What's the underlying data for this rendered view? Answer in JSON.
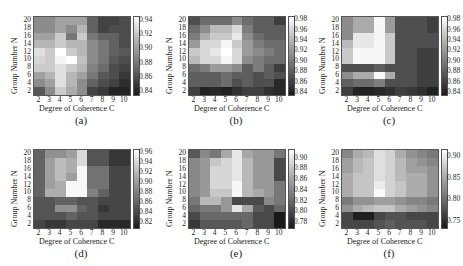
{
  "chart_data": [
    {
      "type": "heatmap",
      "caption": "(a)",
      "xlabel": "Degree of Coherence C",
      "ylabel": "Group Number N",
      "x_ticks": [
        "2",
        "3",
        "4",
        "5",
        "6",
        "7",
        "8",
        "9",
        "10"
      ],
      "y_ticks": [
        "20",
        "18",
        "16",
        "14",
        "12",
        "10",
        "8",
        "6",
        "4",
        "2"
      ],
      "colorbar_ticks": [
        "0.94",
        "0.92",
        "0.90",
        "0.88",
        "0.86",
        "0.84"
      ],
      "vrange": [
        0.835,
        0.945
      ],
      "values": [
        [
          0.89,
          0.89,
          0.9,
          0.9,
          0.9,
          0.87,
          0.855,
          0.855,
          0.86
        ],
        [
          0.89,
          0.89,
          0.9,
          0.89,
          0.91,
          0.87,
          0.855,
          0.86,
          0.86
        ],
        [
          0.9,
          0.9,
          0.92,
          0.88,
          0.92,
          0.88,
          0.87,
          0.87,
          0.86
        ],
        [
          0.91,
          0.91,
          0.92,
          0.91,
          0.91,
          0.89,
          0.88,
          0.87,
          0.86
        ],
        [
          0.93,
          0.92,
          0.945,
          0.92,
          0.91,
          0.89,
          0.88,
          0.87,
          0.865
        ],
        [
          0.925,
          0.92,
          0.94,
          0.945,
          0.915,
          0.89,
          0.88,
          0.865,
          0.86
        ],
        [
          0.92,
          0.92,
          0.93,
          0.92,
          0.91,
          0.885,
          0.875,
          0.86,
          0.855
        ],
        [
          0.9,
          0.91,
          0.93,
          0.91,
          0.9,
          0.88,
          0.865,
          0.86,
          0.85
        ],
        [
          0.89,
          0.9,
          0.93,
          0.91,
          0.89,
          0.87,
          0.86,
          0.855,
          0.845
        ],
        [
          0.865,
          0.89,
          0.92,
          0.905,
          0.89,
          0.855,
          0.85,
          0.84,
          0.84
        ]
      ]
    },
    {
      "type": "heatmap",
      "caption": "(b)",
      "xlabel": "Degree of Coherence C",
      "ylabel": "Group Number N",
      "x_ticks": [
        "2",
        "3",
        "4",
        "5",
        "6",
        "7",
        "8",
        "9",
        "10"
      ],
      "y_ticks": [
        "20",
        "18",
        "16",
        "14",
        "12",
        "10",
        "8",
        "6",
        "4",
        "2"
      ],
      "colorbar_ticks": [
        "0.98",
        "0.96",
        "0.94",
        "0.92",
        "0.90",
        "0.88",
        "0.86",
        "0.84"
      ],
      "vrange": [
        0.835,
        0.985
      ],
      "values": [
        [
          0.87,
          0.89,
          0.89,
          0.89,
          0.91,
          0.89,
          0.88,
          0.88,
          0.86
        ],
        [
          0.89,
          0.91,
          0.94,
          0.94,
          0.96,
          0.9,
          0.88,
          0.88,
          0.88
        ],
        [
          0.9,
          0.93,
          0.95,
          0.95,
          0.97,
          0.91,
          0.89,
          0.88,
          0.88
        ],
        [
          0.92,
          0.96,
          0.96,
          0.98,
          0.95,
          0.92,
          0.9,
          0.89,
          0.89
        ],
        [
          0.95,
          0.96,
          0.97,
          0.985,
          0.96,
          0.92,
          0.91,
          0.9,
          0.89
        ],
        [
          0.94,
          0.96,
          0.96,
          0.98,
          0.96,
          0.91,
          0.9,
          0.89,
          0.89
        ],
        [
          0.89,
          0.9,
          0.92,
          0.92,
          0.91,
          0.88,
          0.9,
          0.88,
          0.86
        ],
        [
          0.88,
          0.88,
          0.88,
          0.89,
          0.88,
          0.88,
          0.87,
          0.88,
          0.87
        ],
        [
          0.88,
          0.88,
          0.88,
          0.89,
          0.87,
          0.88,
          0.87,
          0.87,
          0.845
        ],
        [
          0.86,
          0.84,
          0.845,
          0.84,
          0.85,
          0.86,
          0.86,
          0.85,
          0.845
        ]
      ]
    },
    {
      "type": "heatmap",
      "caption": "(c)",
      "xlabel": "Degree of Coherence C",
      "ylabel": "Group Number N",
      "x_ticks": [
        "2",
        "3",
        "4",
        "5",
        "6",
        "7",
        "8",
        "9",
        "10"
      ],
      "y_ticks": [
        "20",
        "18",
        "16",
        "14",
        "12",
        "10",
        "8",
        "6",
        "4",
        "2"
      ],
      "colorbar_ticks": [
        "0.98",
        "0.96",
        "0.94",
        "0.92",
        "0.90",
        "0.88",
        "0.86",
        "0.84"
      ],
      "vrange": [
        0.835,
        0.985
      ],
      "values": [
        [
          0.91,
          0.93,
          0.93,
          0.98,
          0.92,
          0.87,
          0.87,
          0.87,
          0.86
        ],
        [
          0.91,
          0.93,
          0.93,
          0.98,
          0.92,
          0.87,
          0.87,
          0.87,
          0.86
        ],
        [
          0.91,
          0.97,
          0.97,
          0.98,
          0.95,
          0.87,
          0.87,
          0.87,
          0.87
        ],
        [
          0.94,
          0.97,
          0.97,
          0.98,
          0.95,
          0.87,
          0.87,
          0.87,
          0.87
        ],
        [
          0.95,
          0.98,
          0.98,
          0.98,
          0.95,
          0.87,
          0.87,
          0.86,
          0.86
        ],
        [
          0.95,
          0.98,
          0.98,
          0.98,
          0.95,
          0.87,
          0.87,
          0.86,
          0.86
        ],
        [
          0.87,
          0.87,
          0.87,
          0.88,
          0.87,
          0.87,
          0.87,
          0.86,
          0.86
        ],
        [
          0.91,
          0.93,
          0.93,
          0.98,
          0.93,
          0.87,
          0.87,
          0.86,
          0.86
        ],
        [
          0.88,
          0.89,
          0.89,
          0.9,
          0.87,
          0.87,
          0.87,
          0.86,
          0.86
        ],
        [
          0.86,
          0.84,
          0.84,
          0.845,
          0.85,
          0.86,
          0.855,
          0.85,
          0.84
        ]
      ]
    },
    {
      "type": "heatmap",
      "caption": "(d)",
      "xlabel": "Degree of Coherence C",
      "ylabel": "Group Number N",
      "x_ticks": [
        "2",
        "3",
        "4",
        "5",
        "6",
        "7",
        "8",
        "9",
        "10"
      ],
      "y_ticks": [
        "20",
        "18",
        "16",
        "14",
        "12",
        "10",
        "8",
        "6",
        "4",
        "2"
      ],
      "colorbar_ticks": [
        "0.96",
        "0.94",
        "0.92",
        "0.90",
        "0.88",
        "0.86",
        "0.84",
        "0.82"
      ],
      "vrange": [
        0.81,
        0.965
      ],
      "values": [
        [
          0.86,
          0.89,
          0.89,
          0.9,
          0.94,
          0.85,
          0.85,
          0.83,
          0.83
        ],
        [
          0.86,
          0.9,
          0.92,
          0.91,
          0.94,
          0.85,
          0.85,
          0.83,
          0.83
        ],
        [
          0.86,
          0.9,
          0.92,
          0.91,
          0.96,
          0.87,
          0.87,
          0.84,
          0.84
        ],
        [
          0.86,
          0.9,
          0.92,
          0.9,
          0.96,
          0.87,
          0.87,
          0.84,
          0.84
        ],
        [
          0.86,
          0.9,
          0.91,
          0.96,
          0.96,
          0.87,
          0.87,
          0.84,
          0.84
        ],
        [
          0.86,
          0.91,
          0.91,
          0.96,
          0.96,
          0.88,
          0.86,
          0.84,
          0.84
        ],
        [
          0.85,
          0.85,
          0.86,
          0.86,
          0.85,
          0.85,
          0.84,
          0.84,
          0.84
        ],
        [
          0.85,
          0.85,
          0.89,
          0.89,
          0.86,
          0.85,
          0.83,
          0.84,
          0.84
        ],
        [
          0.85,
          0.85,
          0.85,
          0.86,
          0.85,
          0.85,
          0.84,
          0.84,
          0.84
        ],
        [
          0.84,
          0.83,
          0.83,
          0.84,
          0.84,
          0.84,
          0.82,
          0.82,
          0.82
        ]
      ]
    },
    {
      "type": "heatmap",
      "caption": "(e)",
      "xlabel": "Degree of Coherence C",
      "ylabel": "Group Number N",
      "x_ticks": [
        "2",
        "3",
        "4",
        "5",
        "6",
        "7",
        "8",
        "9",
        "10"
      ],
      "y_ticks": [
        "20",
        "18",
        "16",
        "14",
        "12",
        "10",
        "8",
        "6",
        "4",
        "2"
      ],
      "colorbar_ticks": [
        "0.90",
        "0.88",
        "0.86",
        "0.84",
        "0.82",
        "0.80",
        "0.78"
      ],
      "vrange": [
        0.77,
        0.915
      ],
      "values": [
        [
          0.81,
          0.84,
          0.83,
          0.86,
          0.9,
          0.86,
          0.85,
          0.85,
          0.83
        ],
        [
          0.84,
          0.85,
          0.88,
          0.89,
          0.9,
          0.87,
          0.85,
          0.85,
          0.8
        ],
        [
          0.84,
          0.85,
          0.89,
          0.89,
          0.9,
          0.87,
          0.85,
          0.85,
          0.8
        ],
        [
          0.84,
          0.85,
          0.89,
          0.89,
          0.9,
          0.87,
          0.85,
          0.85,
          0.8
        ],
        [
          0.84,
          0.85,
          0.89,
          0.89,
          0.91,
          0.87,
          0.85,
          0.85,
          0.83
        ],
        [
          0.84,
          0.85,
          0.88,
          0.88,
          0.91,
          0.87,
          0.86,
          0.85,
          0.83
        ],
        [
          0.83,
          0.87,
          0.87,
          0.85,
          0.8,
          0.8,
          0.8,
          0.84,
          0.83
        ],
        [
          0.82,
          0.83,
          0.83,
          0.85,
          0.9,
          0.86,
          0.81,
          0.8,
          0.82
        ],
        [
          0.8,
          0.82,
          0.82,
          0.82,
          0.82,
          0.82,
          0.8,
          0.8,
          0.77
        ],
        [
          0.79,
          0.81,
          0.81,
          0.81,
          0.81,
          0.82,
          0.8,
          0.8,
          0.77
        ]
      ]
    },
    {
      "type": "heatmap",
      "caption": "(f)",
      "xlabel": "Degree of Coherence C",
      "ylabel": "Group Number N",
      "x_ticks": [
        "2",
        "3",
        "4",
        "5",
        "6",
        "7",
        "8",
        "9",
        "10"
      ],
      "y_ticks": [
        "20",
        "18",
        "16",
        "14",
        "12",
        "10",
        "8",
        "6",
        "4",
        "2"
      ],
      "colorbar_ticks": [
        "0.90",
        "0.85",
        "0.80",
        "0.75"
      ],
      "vrange": [
        0.735,
        0.915
      ],
      "values": [
        [
          0.82,
          0.85,
          0.86,
          0.89,
          0.88,
          0.85,
          0.83,
          0.82,
          0.81
        ],
        [
          0.84,
          0.86,
          0.87,
          0.89,
          0.88,
          0.86,
          0.84,
          0.83,
          0.82
        ],
        [
          0.84,
          0.86,
          0.87,
          0.89,
          0.88,
          0.86,
          0.84,
          0.84,
          0.83
        ],
        [
          0.85,
          0.87,
          0.87,
          0.89,
          0.88,
          0.86,
          0.85,
          0.85,
          0.83
        ],
        [
          0.85,
          0.87,
          0.87,
          0.9,
          0.88,
          0.87,
          0.85,
          0.85,
          0.83
        ],
        [
          0.85,
          0.87,
          0.87,
          0.91,
          0.88,
          0.87,
          0.85,
          0.85,
          0.83
        ],
        [
          0.81,
          0.83,
          0.83,
          0.84,
          0.84,
          0.83,
          0.82,
          0.82,
          0.81
        ],
        [
          0.83,
          0.85,
          0.86,
          0.87,
          0.87,
          0.85,
          0.84,
          0.83,
          0.82
        ],
        [
          0.77,
          0.74,
          0.74,
          0.77,
          0.78,
          0.78,
          0.77,
          0.77,
          0.77
        ],
        [
          0.77,
          0.77,
          0.77,
          0.78,
          0.79,
          0.78,
          0.78,
          0.78,
          0.77
        ]
      ]
    }
  ]
}
